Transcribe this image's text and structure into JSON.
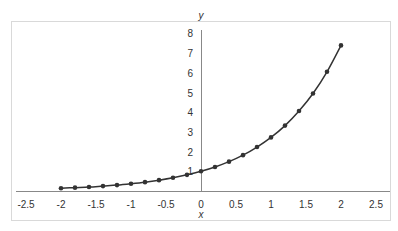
{
  "chart_data": {
    "type": "line",
    "title": "",
    "xlabel": "x",
    "ylabel": "y",
    "xlim": [
      -2.5,
      2.5
    ],
    "ylim": [
      0,
      8
    ],
    "xticks": [
      -2.5,
      -2,
      -1.5,
      -1,
      -0.5,
      0,
      0.5,
      1,
      1.5,
      2,
      2.5
    ],
    "yticks": [
      1,
      2,
      3,
      4,
      5,
      6,
      7,
      8
    ],
    "grid": false,
    "legend": null,
    "series": [
      {
        "name": "y = e^x",
        "marker": "circle",
        "color": "#333333",
        "x": [
          -2,
          -1.8,
          -1.6,
          -1.4,
          -1.2,
          -1,
          -0.8,
          -0.6,
          -0.4,
          -0.2,
          0,
          0.2,
          0.4,
          0.6,
          0.8,
          1,
          1.2,
          1.4,
          1.6,
          1.8,
          2
        ],
        "y": [
          0.14,
          0.17,
          0.2,
          0.25,
          0.3,
          0.37,
          0.45,
          0.55,
          0.67,
          0.82,
          1.0,
          1.22,
          1.49,
          1.82,
          2.23,
          2.72,
          3.32,
          4.06,
          4.95,
          6.05,
          7.39
        ]
      }
    ]
  },
  "colors": {
    "frame": "#d9d9d9",
    "axis": "#888888",
    "line": "#333333"
  }
}
